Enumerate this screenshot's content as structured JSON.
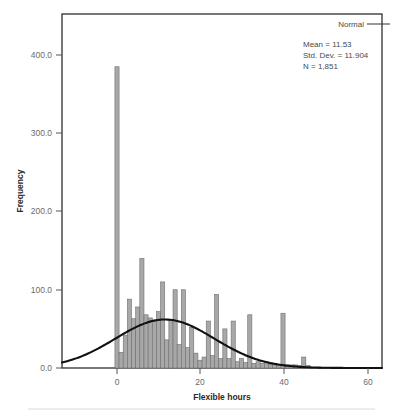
{
  "chart_data": {
    "type": "bar",
    "title": "",
    "xlabel": "Flexible hours",
    "ylabel": "Frequency",
    "xlim": [
      -9,
      68
    ],
    "ylim": [
      0,
      430
    ],
    "xticks": [
      0,
      20,
      40,
      60
    ],
    "xtick_labels": [
      "0",
      "20",
      "40",
      "60"
    ],
    "yticks": [
      0,
      100,
      200,
      300,
      400
    ],
    "ytick_labels": [
      "0.0",
      "100.0",
      "200.0",
      "300.0",
      "400.0"
    ],
    "grid": false,
    "bin_width": 1,
    "categories": [
      0,
      1,
      2,
      3,
      4,
      5,
      6,
      7,
      8,
      9,
      10,
      11,
      12,
      13,
      14,
      15,
      16,
      17,
      18,
      19,
      20,
      21,
      22,
      23,
      24,
      25,
      26,
      27,
      28,
      29,
      30,
      31,
      32,
      33,
      34,
      35,
      36,
      37,
      38,
      39,
      40,
      41,
      42,
      43,
      44,
      45,
      46
    ],
    "values": [
      385,
      20,
      42,
      88,
      63,
      78,
      140,
      68,
      64,
      60,
      72,
      110,
      36,
      62,
      100,
      30,
      100,
      26,
      52,
      19,
      10,
      14,
      60,
      16,
      94,
      12,
      50,
      12,
      60,
      8,
      12,
      7,
      68,
      6,
      8,
      6,
      8,
      5,
      6,
      4,
      70,
      4,
      4,
      4,
      3,
      14,
      3
    ],
    "series": [
      {
        "name": "Frequency",
        "values": [
          385,
          20,
          42,
          88,
          63,
          78,
          140,
          68,
          64,
          60,
          72,
          110,
          36,
          62,
          100,
          30,
          100,
          26,
          52,
          19,
          10,
          14,
          60,
          16,
          94,
          12,
          50,
          12,
          60,
          8,
          12,
          7,
          68,
          6,
          8,
          6,
          8,
          5,
          6,
          4,
          70,
          4,
          4,
          4,
          3,
          14,
          3
        ]
      }
    ],
    "overlay": {
      "type": "line",
      "name": "Normal",
      "mean": 11.53,
      "std_dev": 11.904,
      "n": 1851,
      "peak_value": 62
    },
    "legend": {
      "position": "top-right",
      "entries": [
        "Normal"
      ]
    },
    "annotations": {
      "mean": "Mean = 11.53",
      "std_dev": "Std. Dev. = 11.904",
      "n": "N = 1,851"
    },
    "colors": {
      "bar_fill": "#a8a8a8",
      "bar_stroke": "#6e6e6e",
      "curve": "#111111",
      "frame": "#2f2f2f",
      "text": "#4a4a4a"
    }
  },
  "legend": {
    "normal_label": "Normal"
  },
  "stats": {
    "mean": "Mean = 11.53",
    "std_dev": "Std. Dev. = 11.904",
    "n": "N = 1,851"
  },
  "axes": {
    "x_title": "Flexible hours",
    "y_title": "Frequency",
    "x_ticks": [
      "0",
      "20",
      "40",
      "60"
    ],
    "y_ticks": [
      "0.0",
      "100.0",
      "200.0",
      "300.0",
      "400.0"
    ]
  }
}
